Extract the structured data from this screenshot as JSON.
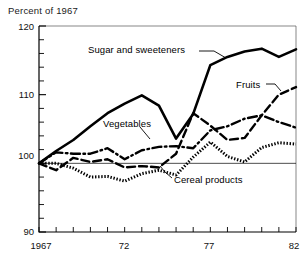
{
  "chart_data": {
    "type": "line",
    "title": "Percent of 1967",
    "xlabel": "",
    "ylabel": "",
    "ylim": [
      90,
      120
    ],
    "xlim": [
      1967,
      1982
    ],
    "grid": false,
    "legend_position": "inline-annotations",
    "y_ticks": [
      90,
      100,
      110,
      120
    ],
    "y_tick_labels": [
      "90",
      "100",
      "110",
      "120"
    ],
    "y_minor_tick_step": 2,
    "x_ticks": [
      1967,
      1968,
      1969,
      1970,
      1971,
      1972,
      1973,
      1974,
      1975,
      1976,
      1977,
      1978,
      1979,
      1980,
      1981,
      1982
    ],
    "x_tick_labels_shown": [
      {
        "x": 1967,
        "label": "1967"
      },
      {
        "x": 1972,
        "label": "72"
      },
      {
        "x": 1977,
        "label": "77"
      },
      {
        "x": 1982,
        "label": "82"
      }
    ],
    "reference_line": 100,
    "x": [
      1967,
      1968,
      1969,
      1970,
      1971,
      1972,
      1973,
      1974,
      1975,
      1976,
      1977,
      1978,
      1979,
      1980,
      1981,
      1982
    ],
    "series": [
      {
        "name": "Sugar and sweeteners",
        "style": "solid",
        "values": [
          100.0,
          101.8,
          103.4,
          105.4,
          107.3,
          108.7,
          109.9,
          108.4,
          103.6,
          107.2,
          114.3,
          115.5,
          116.3,
          116.7,
          115.5,
          116.6
        ]
      },
      {
        "name": "Fruits",
        "style": "dashed",
        "values": [
          100.0,
          99.0,
          100.8,
          100.2,
          100.6,
          99.4,
          99.6,
          99.4,
          101.4,
          107.3,
          105.5,
          103.4,
          103.7,
          107.0,
          110.0,
          111.1
        ]
      },
      {
        "name": "Vegetables",
        "style": "dash-dot",
        "values": [
          100.0,
          101.6,
          101.4,
          101.4,
          102.2,
          100.6,
          101.9,
          102.4,
          102.5,
          102.2,
          104.8,
          105.4,
          106.5,
          107.0,
          106.0,
          105.2
        ]
      },
      {
        "name": "Cereal products",
        "style": "dotted",
        "values": [
          100.0,
          100.0,
          99.3,
          98.0,
          98.1,
          97.4,
          98.5,
          99.0,
          98.3,
          100.9,
          103.1,
          101.0,
          100.2,
          102.3,
          103.0,
          102.8
        ]
      }
    ],
    "annotations": [
      {
        "text": "Sugar and sweeteners",
        "target_series": "Sugar and sweeteners"
      },
      {
        "text": "Fruits",
        "target_series": "Fruits"
      },
      {
        "text": "Vegetables",
        "target_series": "Vegetables"
      },
      {
        "text": "Cereal products",
        "target_series": "Cereal products"
      }
    ]
  },
  "axis": {
    "title": "Percent of 1967",
    "y_labels": [
      "120",
      "110",
      "100",
      "90"
    ],
    "x_labels": [
      "1967",
      "72",
      "77",
      "82"
    ]
  },
  "labels": {
    "sugar": "Sugar and sweeteners",
    "fruits": "Fruits",
    "vegetables": "Vegetables",
    "cereal": "Cereal products"
  },
  "colors": {
    "line": "#000000",
    "background": "#ffffff",
    "axis": "#000000"
  }
}
